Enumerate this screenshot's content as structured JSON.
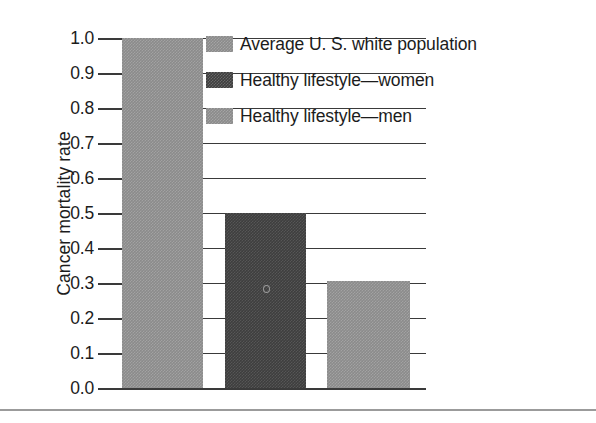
{
  "chart_data": {
    "type": "bar",
    "title": "",
    "xlabel": "",
    "ylabel": "Cancer mortality rate",
    "ylim": [
      0.0,
      1.0
    ],
    "grid": true,
    "legend_position": "top-right-inside",
    "categories": [
      "Average U. S. white population",
      "Healthy lifestyle—women",
      "Healthy lifestyle—men"
    ],
    "values": [
      1.0,
      0.5,
      0.305
    ],
    "ytick_labels": [
      "1.0",
      "0.9",
      "0.8",
      "0.7",
      "0.6",
      "0.5",
      "0.4",
      "0.3",
      "0.2",
      "0.1",
      "0.0"
    ],
    "ytick_values": [
      1.0,
      0.9,
      0.8,
      0.7,
      0.6,
      0.5,
      0.4,
      0.3,
      0.2,
      0.1,
      0.0
    ],
    "series": [
      {
        "name": "Average U. S. white population",
        "value": 1.0,
        "color": "#8b8b8b",
        "fill": "medium-gray-dither"
      },
      {
        "name": "Healthy lifestyle—women",
        "value": 0.5,
        "color": "#3e3e3e",
        "fill": "dark-gray-dither"
      },
      {
        "name": "Healthy lifestyle—men",
        "value": 0.305,
        "color": "#8b8b8b",
        "fill": "medium-gray-dither"
      }
    ]
  },
  "axis": {
    "y_title": "Cancer mortality rate"
  },
  "legend": {
    "items": [
      {
        "label": "Average U. S. white population",
        "color": "#8b8b8b",
        "swatch": "medium"
      },
      {
        "label": "Healthy lifestyle—women",
        "color": "#3e3e3e",
        "swatch": "dark"
      },
      {
        "label": "Healthy lifestyle—men",
        "color": "#8b8b8b",
        "swatch": "medium"
      }
    ]
  },
  "colors": {
    "medium_gray": "#8b8b8b",
    "dark_gray": "#3e3e3e",
    "axis_line": "#3a3a3a",
    "rule": "#9b9b9b",
    "text": "#1c1c1c",
    "background": "#ffffff"
  }
}
